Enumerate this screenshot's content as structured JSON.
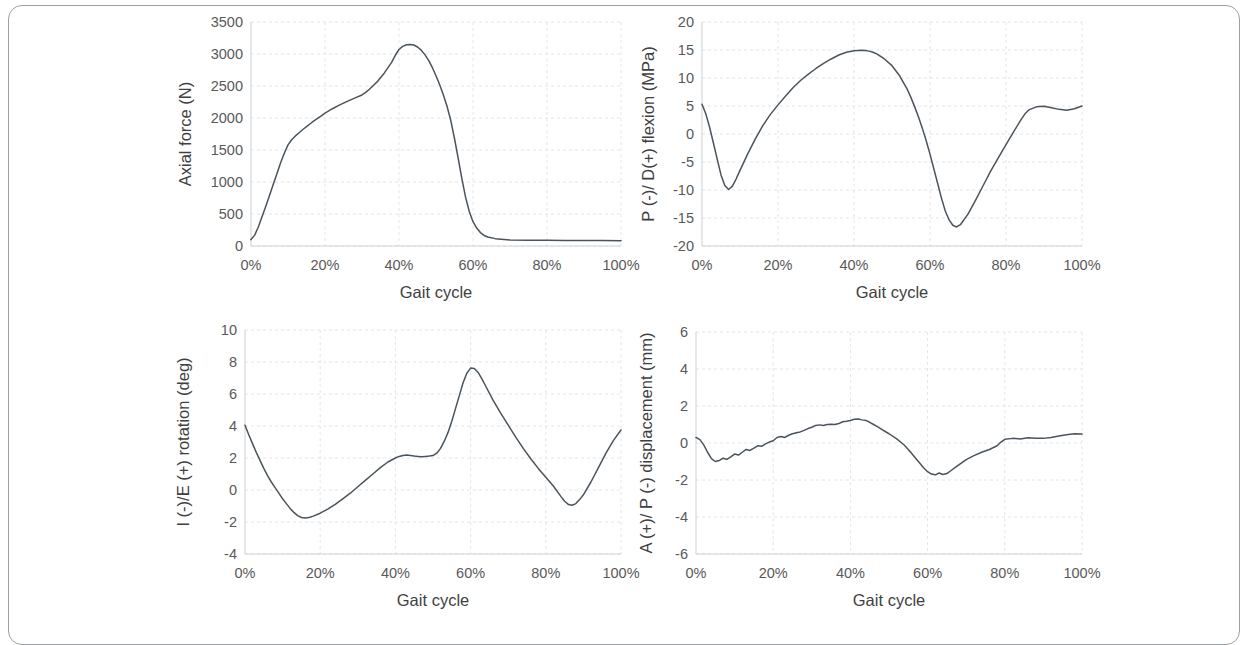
{
  "figure": {
    "border_color": "#9aa0a3",
    "line_color": "#4b545c",
    "grid_color": "#e3e6ea",
    "background": "#ffffff"
  },
  "chart_data": [
    {
      "id": "axial-force",
      "type": "line",
      "title": "",
      "xlabel": "Gait cycle",
      "ylabel": "Axial force (N)",
      "xlim": [
        0,
        100
      ],
      "ylim": [
        0,
        3500
      ],
      "grid": true,
      "legend": "none",
      "xticks": [
        "0%",
        "20%",
        "40%",
        "60%",
        "80%",
        "100%"
      ],
      "xtick_values": [
        0,
        20,
        40,
        60,
        80,
        100
      ],
      "yticks": [
        "0",
        "500",
        "1000",
        "1500",
        "2000",
        "2500",
        "3000",
        "3500"
      ],
      "ytick_values": [
        0,
        500,
        1000,
        1500,
        2000,
        2500,
        3000,
        3500
      ],
      "series": [
        {
          "name": "Axial force",
          "x": [
            0,
            1,
            2,
            3,
            4,
            5,
            6,
            7,
            8,
            9,
            10,
            11,
            12,
            13,
            14,
            15,
            16,
            17,
            18,
            19,
            20,
            22,
            24,
            26,
            28,
            30,
            31,
            32,
            34,
            36,
            38,
            39,
            40,
            41,
            42,
            43,
            44,
            45,
            46,
            47,
            48,
            49,
            50,
            51,
            52,
            53,
            54,
            55,
            56,
            57,
            58,
            59,
            60,
            61,
            62,
            63,
            64,
            66,
            70,
            75,
            80,
            85,
            90,
            95,
            100
          ],
          "values": [
            100,
            170,
            300,
            460,
            620,
            790,
            960,
            1130,
            1300,
            1450,
            1580,
            1660,
            1720,
            1770,
            1820,
            1865,
            1910,
            1955,
            1995,
            2035,
            2075,
            2145,
            2205,
            2260,
            2310,
            2360,
            2400,
            2450,
            2560,
            2700,
            2870,
            2980,
            3070,
            3120,
            3145,
            3150,
            3140,
            3110,
            3060,
            2990,
            2900,
            2790,
            2660,
            2520,
            2360,
            2180,
            1960,
            1680,
            1370,
            1050,
            760,
            540,
            380,
            280,
            210,
            165,
            140,
            115,
            95,
            90,
            88,
            86,
            85,
            84,
            83
          ]
        }
      ]
    },
    {
      "id": "flexion-stress",
      "type": "line",
      "title": "",
      "xlabel": "Gait cycle",
      "ylabel": "P (-)/ D(+) flexion (MPa)",
      "xlim": [
        0,
        100
      ],
      "ylim": [
        -20,
        20
      ],
      "grid": true,
      "legend": "none",
      "xticks": [
        "0%",
        "20%",
        "40%",
        "60%",
        "80%",
        "100%"
      ],
      "xtick_values": [
        0,
        20,
        40,
        60,
        80,
        100
      ],
      "yticks": [
        "-20",
        "-15",
        "-10",
        "-5",
        "0",
        "5",
        "10",
        "15",
        "20"
      ],
      "ytick_values": [
        -20,
        -15,
        -10,
        -5,
        0,
        5,
        10,
        15,
        20
      ],
      "series": [
        {
          "name": "Flexion stress",
          "x": [
            0,
            1,
            2,
            3,
            4,
            5,
            6,
            7,
            8,
            9,
            10,
            12,
            14,
            16,
            18,
            20,
            22,
            24,
            26,
            28,
            30,
            32,
            34,
            36,
            38,
            40,
            42,
            43,
            44,
            45,
            46,
            48,
            50,
            52,
            54,
            55,
            56,
            57,
            58,
            59,
            60,
            61,
            62,
            63,
            64,
            65,
            66,
            67,
            68,
            70,
            72,
            74,
            76,
            78,
            80,
            82,
            84,
            85,
            86,
            88,
            90,
            92,
            94,
            96,
            98,
            100
          ],
          "values": [
            5.3,
            3.6,
            1.2,
            -1.6,
            -4.5,
            -7.3,
            -9.2,
            -9.9,
            -9.3,
            -8.0,
            -6.5,
            -3.6,
            -0.9,
            1.5,
            3.5,
            5.2,
            6.8,
            8.3,
            9.6,
            10.7,
            11.7,
            12.6,
            13.4,
            14.1,
            14.6,
            14.85,
            14.95,
            14.9,
            14.8,
            14.6,
            14.3,
            13.4,
            12.2,
            10.4,
            8.0,
            6.5,
            4.8,
            3.0,
            1.0,
            -1.2,
            -3.6,
            -6.2,
            -8.8,
            -11.4,
            -13.7,
            -15.3,
            -16.3,
            -16.6,
            -16.2,
            -14.3,
            -11.8,
            -9.2,
            -6.6,
            -4.2,
            -1.9,
            0.4,
            2.6,
            3.6,
            4.3,
            4.85,
            4.95,
            4.7,
            4.4,
            4.25,
            4.5,
            5.0
          ]
        }
      ]
    },
    {
      "id": "rotation",
      "type": "line",
      "title": "",
      "xlabel": "Gait cycle",
      "ylabel": "I (-)/E (+) rotation  (deg)",
      "xlim": [
        0,
        100
      ],
      "ylim": [
        -4,
        10
      ],
      "grid": true,
      "legend": "none",
      "xticks": [
        "0%",
        "20%",
        "40%",
        "60%",
        "80%",
        "100%"
      ],
      "xtick_values": [
        0,
        20,
        40,
        60,
        80,
        100
      ],
      "yticks": [
        "-4",
        "-2",
        "0",
        "2",
        "4",
        "6",
        "8",
        "10"
      ],
      "ytick_values": [
        -4,
        -2,
        0,
        2,
        4,
        6,
        8,
        10
      ],
      "series": [
        {
          "name": "Rotation",
          "x": [
            0,
            1,
            2,
            3,
            4,
            5,
            6,
            7,
            8,
            9,
            10,
            11,
            12,
            13,
            14,
            15,
            16,
            17,
            18,
            20,
            22,
            24,
            26,
            28,
            30,
            32,
            34,
            36,
            38,
            40,
            41,
            42,
            43,
            44,
            45,
            46,
            47,
            48,
            49,
            50,
            51,
            52,
            53,
            54,
            55,
            56,
            57,
            58,
            59,
            60,
            61,
            62,
            63,
            64,
            66,
            68,
            70,
            72,
            74,
            76,
            78,
            80,
            82,
            84,
            85,
            86,
            87,
            88,
            89,
            90,
            92,
            94,
            96,
            98,
            100
          ],
          "values": [
            4.05,
            3.45,
            2.9,
            2.35,
            1.85,
            1.35,
            0.9,
            0.5,
            0.15,
            -0.2,
            -0.55,
            -0.85,
            -1.15,
            -1.4,
            -1.6,
            -1.72,
            -1.75,
            -1.72,
            -1.65,
            -1.45,
            -1.2,
            -0.9,
            -0.55,
            -0.2,
            0.2,
            0.6,
            1.0,
            1.4,
            1.75,
            2.0,
            2.1,
            2.16,
            2.18,
            2.16,
            2.12,
            2.1,
            2.08,
            2.1,
            2.12,
            2.15,
            2.3,
            2.6,
            3.05,
            3.6,
            4.3,
            5.1,
            5.9,
            6.7,
            7.3,
            7.62,
            7.6,
            7.35,
            6.95,
            6.5,
            5.6,
            4.8,
            4.05,
            3.3,
            2.6,
            1.95,
            1.35,
            0.8,
            0.25,
            -0.4,
            -0.7,
            -0.9,
            -0.95,
            -0.85,
            -0.6,
            -0.3,
            0.5,
            1.4,
            2.3,
            3.1,
            3.75
          ]
        }
      ]
    },
    {
      "id": "ap-displacement",
      "type": "line",
      "title": "",
      "xlabel": "Gait cycle",
      "ylabel": "A (+)/ P (-) displacement (mm)",
      "xlim": [
        0,
        100
      ],
      "ylim": [
        -6,
        6
      ],
      "grid": true,
      "legend": "none",
      "xticks": [
        "0%",
        "20%",
        "40%",
        "60%",
        "80%",
        "100%"
      ],
      "xtick_values": [
        0,
        20,
        40,
        60,
        80,
        100
      ],
      "yticks": [
        "-6",
        "-4",
        "-2",
        "0",
        "2",
        "4",
        "6"
      ],
      "ytick_values": [
        -6,
        -4,
        -2,
        0,
        2,
        4,
        6
      ],
      "series": [
        {
          "name": "AP displacement",
          "x": [
            0,
            1,
            2,
            3,
            4,
            5,
            6,
            7,
            8,
            9,
            10,
            11,
            12,
            13,
            14,
            15,
            16,
            17,
            18,
            19,
            20,
            21,
            22,
            23,
            24,
            25,
            26,
            27,
            28,
            29,
            30,
            31,
            32,
            33,
            34,
            35,
            36,
            37,
            38,
            39,
            40,
            41,
            42,
            43,
            44,
            45,
            46,
            47,
            48,
            50,
            52,
            54,
            55,
            56,
            57,
            58,
            59,
            60,
            61,
            62,
            63,
            64,
            65,
            66,
            67,
            68,
            70,
            72,
            74,
            76,
            78,
            79,
            80,
            82,
            84,
            86,
            88,
            90,
            92,
            94,
            96,
            98,
            100
          ],
          "values": [
            0.3,
            0.18,
            -0.1,
            -0.5,
            -0.85,
            -1.0,
            -0.95,
            -0.82,
            -0.88,
            -0.75,
            -0.6,
            -0.65,
            -0.5,
            -0.35,
            -0.4,
            -0.28,
            -0.15,
            -0.18,
            -0.05,
            0.05,
            0.12,
            0.3,
            0.35,
            0.3,
            0.42,
            0.5,
            0.55,
            0.6,
            0.68,
            0.78,
            0.85,
            0.95,
            0.98,
            0.95,
            1.0,
            1.02,
            1.0,
            1.05,
            1.15,
            1.18,
            1.22,
            1.28,
            1.3,
            1.25,
            1.22,
            1.12,
            1.0,
            0.88,
            0.75,
            0.5,
            0.22,
            -0.12,
            -0.35,
            -0.6,
            -0.85,
            -1.1,
            -1.35,
            -1.55,
            -1.68,
            -1.72,
            -1.62,
            -1.7,
            -1.65,
            -1.5,
            -1.35,
            -1.2,
            -0.9,
            -0.68,
            -0.5,
            -0.35,
            -0.15,
            0.05,
            0.2,
            0.25,
            0.22,
            0.28,
            0.26,
            0.25,
            0.3,
            0.38,
            0.45,
            0.5,
            0.48
          ]
        }
      ]
    }
  ]
}
